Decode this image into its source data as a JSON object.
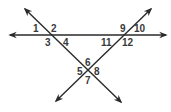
{
  "diagram": {
    "color": "#2a2a2a",
    "lines": [
      {
        "name": "horizontal-line",
        "from": [
          8,
          35
        ],
        "to": [
          168,
          35
        ],
        "arrows": "both"
      },
      {
        "name": "descending-line",
        "from": [
          23,
          7
        ],
        "to": [
          123,
          104
        ],
        "arrows": "both"
      },
      {
        "name": "ascending-line",
        "from": [
          153,
          7
        ],
        "to": [
          54,
          103
        ],
        "arrows": "both"
      }
    ],
    "intersections": [
      {
        "name": "left",
        "point": [
          50,
          35
        ],
        "angles": [
          "1",
          "2",
          "3",
          "4"
        ]
      },
      {
        "name": "right",
        "point": [
          124,
          35
        ],
        "angles": [
          "9",
          "10",
          "11",
          "12"
        ]
      },
      {
        "name": "bottom",
        "point": [
          88,
          71
        ],
        "angles": [
          "5",
          "6",
          "7",
          "8"
        ]
      }
    ],
    "labels": {
      "a1": "1",
      "a2": "2",
      "a3": "3",
      "a4": "4",
      "a5": "5",
      "a6": "6",
      "a7": "7",
      "a8": "8",
      "a9": "9",
      "a10": "10",
      "a11": "11",
      "a12": "12"
    }
  }
}
